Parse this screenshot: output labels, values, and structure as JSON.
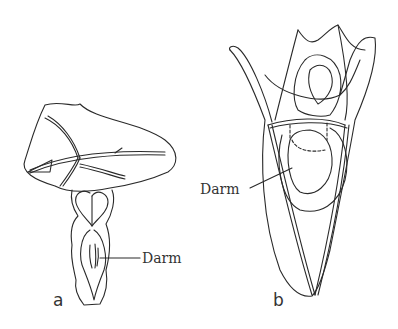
{
  "figure": {
    "panels": [
      {
        "id": "a",
        "label": "a",
        "annotation": "Darm"
      },
      {
        "id": "b",
        "label": "b",
        "annotation": "Darm"
      }
    ],
    "line_color": "#2a2a2a",
    "background": "#ffffff"
  }
}
